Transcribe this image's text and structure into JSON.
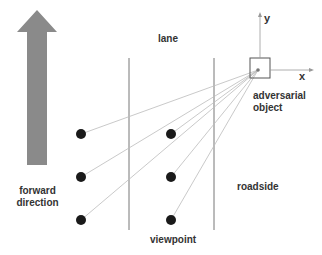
{
  "labels": {
    "lane": "lane",
    "adversarial_object_line1": "adversarial",
    "adversarial_object_line2": "object",
    "forward_line1": "forward",
    "forward_line2": "direction",
    "roadside": "roadside",
    "viewpoint": "viewpoint",
    "axis_x": "x",
    "axis_y": "y"
  },
  "colors": {
    "arrow": "#8a8a8a",
    "lines": "#555555",
    "rays": "#b0b0b0",
    "dots": "#1a1a1a"
  },
  "viewpoints": [
    {
      "x": 81,
      "y": 134
    },
    {
      "x": 81,
      "y": 177
    },
    {
      "x": 81,
      "y": 220
    },
    {
      "x": 171,
      "y": 134
    },
    {
      "x": 171,
      "y": 177
    },
    {
      "x": 171,
      "y": 220
    }
  ]
}
